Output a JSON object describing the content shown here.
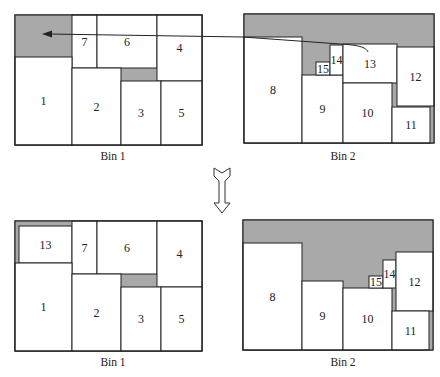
{
  "figure": {
    "width": 440,
    "height": 377,
    "colors": {
      "waste": "#a9a9a9",
      "stroke": "#222222",
      "item_fill": "#ffffff"
    },
    "panels": [
      {
        "id": "before",
        "bins": [
          {
            "caption": "Bin 1",
            "caption_pos": [
              113,
              156
            ],
            "frame": [
              15,
              15,
              187,
              130
            ],
            "waste": [
              [
                15,
                15,
                57,
                42
              ],
              [
                121,
                68,
                36,
                13
              ]
            ],
            "items": [
              {
                "label": "7",
                "rect": [
                  72,
                  15,
                  25,
                  53
                ]
              },
              {
                "label": "6",
                "rect": [
                  97,
                  15,
                  60,
                  53
                ]
              },
              {
                "label": "4",
                "rect": [
                  157,
                  15,
                  45,
                  66
                ]
              },
              {
                "label": "1",
                "rect": [
                  15,
                  57,
                  57,
                  88
                ]
              },
              {
                "label": "2",
                "rect": [
                  72,
                  68,
                  49,
                  77
                ]
              },
              {
                "label": "3",
                "rect": [
                  121,
                  81,
                  40,
                  64
                ]
              },
              {
                "label": "5",
                "rect": [
                  161,
                  81,
                  41,
                  64
                ]
              }
            ]
          },
          {
            "caption": "Bin 2",
            "caption_pos": [
              343,
              156
            ],
            "frame": [
              244,
              14,
              190,
              129
            ],
            "waste": [
              [
                244,
                14,
                190,
                129
              ]
            ],
            "items": [
              {
                "label": "8",
                "rect": [
                  244,
                  37,
                  58,
                  106
                ]
              },
              {
                "label": "9",
                "rect": [
                  302,
                  75,
                  41,
                  68
                ]
              },
              {
                "label": "15",
                "rect": [
                  316,
                  62,
                  14,
                  13
                ]
              },
              {
                "label": "14",
                "rect": [
                  330,
                  45,
                  13,
                  30
                ]
              },
              {
                "label": "13",
                "rect": [
                  343,
                  44,
                  54,
                  39
                ]
              },
              {
                "label": "10",
                "rect": [
                  343,
                  83,
                  49,
                  60
                ]
              },
              {
                "label": "12",
                "rect": [
                  397,
                  47,
                  37,
                  59
                ]
              },
              {
                "label": "11",
                "rect": [
                  392,
                  107,
                  38,
                  36
                ]
              }
            ]
          }
        ],
        "move_arrow": {
          "from_item": "13",
          "to_bin": "Bin 1",
          "path": "M 368 52 C 366 47, 358 45, 340 44 L 243 37 L 48 34",
          "head": "42,34 52,30.5 52,37.5"
        }
      },
      {
        "id": "after",
        "bins": [
          {
            "caption": "Bin 1",
            "caption_pos": [
              113,
              362
            ],
            "frame": [
              15,
              221,
              187,
              130
            ],
            "waste": [
              [
                15,
                221,
                57,
                42
              ],
              [
                121,
                274,
                36,
                13
              ]
            ],
            "items": [
              {
                "label": "13",
                "rect": [
                  19,
                  226,
                  53,
                  37
                ]
              },
              {
                "label": "7",
                "rect": [
                  72,
                  221,
                  25,
                  53
                ]
              },
              {
                "label": "6",
                "rect": [
                  97,
                  221,
                  60,
                  53
                ]
              },
              {
                "label": "4",
                "rect": [
                  157,
                  221,
                  45,
                  66
                ]
              },
              {
                "label": "1",
                "rect": [
                  15,
                  263,
                  57,
                  88
                ]
              },
              {
                "label": "2",
                "rect": [
                  72,
                  274,
                  49,
                  77
                ]
              },
              {
                "label": "3",
                "rect": [
                  121,
                  287,
                  40,
                  64
                ]
              },
              {
                "label": "5",
                "rect": [
                  161,
                  287,
                  41,
                  64
                ]
              }
            ]
          },
          {
            "caption": "Bin 2",
            "caption_pos": [
              343,
              362
            ],
            "frame": [
              243,
              220,
              190,
              130
            ],
            "waste": [
              [
                243,
                220,
                190,
                130
              ]
            ],
            "items": [
              {
                "label": "8",
                "rect": [
                  243,
                  243,
                  59,
                  107
                ]
              },
              {
                "label": "9",
                "rect": [
                  302,
                  281,
                  41,
                  69
                ]
              },
              {
                "label": "10",
                "rect": [
                  343,
                  288,
                  49,
                  62
                ]
              },
              {
                "label": "15",
                "rect": [
                  369,
                  276,
                  14,
                  12
                ]
              },
              {
                "label": "14",
                "rect": [
                  383,
                  260,
                  13,
                  28
                ]
              },
              {
                "label": "12",
                "rect": [
                  396,
                  252,
                  37,
                  59
                ]
              },
              {
                "label": "11",
                "rect": [
                  392,
                  311,
                  37,
                  39
                ]
              }
            ]
          }
        ]
      }
    ],
    "transition_arrow": {
      "direction": "down",
      "center_x": 222,
      "top_y": 168,
      "bottom_y": 213
    }
  }
}
